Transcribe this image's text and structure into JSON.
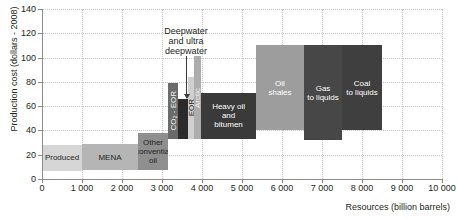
{
  "chart_data": {
    "type": "bar",
    "title": "",
    "xlabel": "Resources (billion barrels)",
    "ylabel": "Production cost (dollars - 2008)",
    "xlim": [
      0,
      10000
    ],
    "ylim": [
      0,
      140
    ],
    "grid": true,
    "legend": "none",
    "xticks": [
      "0",
      "1 000",
      "2 000",
      "3 000",
      "4 000",
      "5 000",
      "6 000",
      "7 000",
      "8 000",
      "9 000",
      "10 000"
    ],
    "xtick_values": [
      0,
      1000,
      2000,
      3000,
      4000,
      5000,
      6000,
      7000,
      8000,
      9000,
      10000
    ],
    "yticks": [
      "0",
      "20",
      "40",
      "60",
      "80",
      "100",
      "120",
      "140"
    ],
    "ytick_values": [
      0,
      20,
      40,
      60,
      80,
      100,
      120,
      140
    ],
    "note": "Stepped cost-supply curve: each block spans a resource range (x) and a production-cost band (y).",
    "bars": [
      {
        "label": "Produced",
        "x_start": 0,
        "x_end": 1000,
        "cost_low": 7,
        "cost_high": 28,
        "color": "#d6d6d6",
        "text_color": "#231f20",
        "orientation": "horizontal"
      },
      {
        "label": "MENA",
        "x_start": 1000,
        "x_end": 2400,
        "cost_low": 7,
        "cost_high": 29,
        "color": "#b5b5b5",
        "text_color": "#231f20",
        "orientation": "horizontal"
      },
      {
        "label": "Other\nconvential\noil",
        "x_start": 2400,
        "x_end": 3150,
        "cost_low": 7,
        "cost_high": 38,
        "color": "#8f8f8f",
        "text_color": "#231f20",
        "orientation": "horizontal"
      },
      {
        "label": "CO₂ - EOR",
        "x_start": 3150,
        "x_end": 3400,
        "cost_low": 33,
        "cost_high": 79,
        "color": "#6b6b6b",
        "text_color": "#f2f2f2",
        "orientation": "vertical"
      },
      {
        "label": "",
        "x_start": 3400,
        "x_end": 3650,
        "cost_low": 33,
        "cost_high": 66,
        "color": "#2b2b2b",
        "text_color": "#f2f2f2",
        "orientation": "vertical"
      },
      {
        "label": "EOR",
        "x_start": 3650,
        "x_end": 3800,
        "cost_low": 33,
        "cost_high": 84,
        "color": "#cfcfcf",
        "text_color": "#231f20",
        "orientation": "vertical"
      },
      {
        "label": "Arctic",
        "x_start": 3800,
        "x_end": 3980,
        "cost_low": 33,
        "cost_high": 101,
        "color": "#adadad",
        "text_color": "#f2f2f2",
        "orientation": "vertical"
      },
      {
        "label": "Heavy oil\nand\nbitumen",
        "x_start": 3980,
        "x_end": 5350,
        "cost_low": 33,
        "cost_high": 71,
        "color": "#3a3a3a",
        "text_color": "#ffffff",
        "orientation": "horizontal"
      },
      {
        "label": "Oil\nshales",
        "x_start": 5350,
        "x_end": 6550,
        "cost_low": 40,
        "cost_high": 110,
        "color": "#9d9d9d",
        "text_color": "#ffffff",
        "orientation": "horizontal"
      },
      {
        "label": "Gas\nto liquids",
        "x_start": 6550,
        "x_end": 7500,
        "cost_low": 32,
        "cost_high": 110,
        "color": "#474747",
        "text_color": "#ffffff",
        "orientation": "horizontal"
      },
      {
        "label": "Coal\nto liquids",
        "x_start": 7500,
        "x_end": 8500,
        "cost_low": 40,
        "cost_high": 110,
        "color": "#3f3f3f",
        "text_color": "#ffffff",
        "orientation": "horizontal"
      }
    ],
    "annotations": [
      {
        "text": "Deepwater\nand ultra\ndeepwater",
        "points_to_x": 3525,
        "points_to_y": 66
      }
    ]
  },
  "axes": {
    "y_title": "Production cost (dollars - 2008)",
    "x_title": "Resources (billion barrels)"
  }
}
